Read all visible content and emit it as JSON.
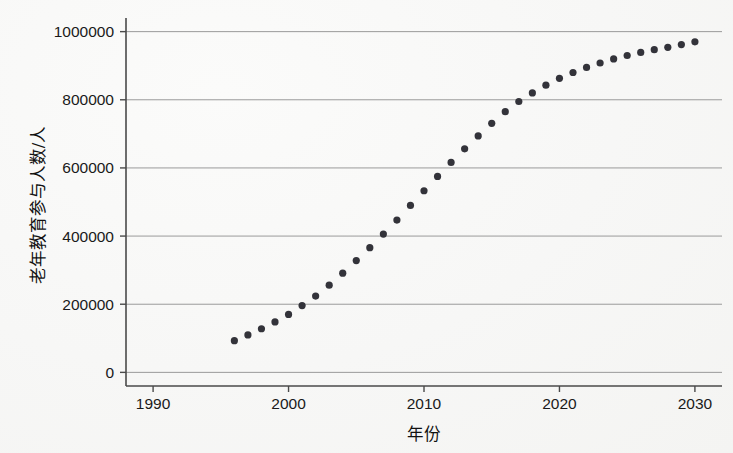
{
  "figure": {
    "background_color": "#f7f7f6",
    "marker_color": "#33333a",
    "grid_color": "#9a9a9a",
    "axis_color": "#4a4a4a"
  },
  "chart_data": {
    "type": "scatter",
    "title": "",
    "xlabel": "年份",
    "ylabel": "老年教育参与人数/人",
    "xlim": [
      1988,
      2032
    ],
    "ylim": [
      -40000,
      1040000
    ],
    "xticks": [
      1990,
      2000,
      2010,
      2020,
      2030
    ],
    "xtick_labels": [
      "1990",
      "2000",
      "2010",
      "2020",
      "2030"
    ],
    "yticks": [
      0,
      200000,
      400000,
      600000,
      800000,
      1000000
    ],
    "ytick_labels": [
      "0",
      "200000",
      "400000",
      "600000",
      "800000",
      "1000000"
    ],
    "grid": true,
    "grid_axis": "y",
    "legend": false,
    "legend_position": "none",
    "series": [
      {
        "name": "老年教育参与人数",
        "marker": "circle",
        "x": [
          1996,
          1997,
          1998,
          1999,
          2000,
          2001,
          2002,
          2003,
          2004,
          2005,
          2006,
          2007,
          2008,
          2009,
          2010,
          2011,
          2012,
          2013,
          2014,
          2015,
          2016,
          2017,
          2018,
          2019,
          2020,
          2021,
          2022,
          2023,
          2024,
          2025,
          2026,
          2027,
          2028,
          2029,
          2030
        ],
        "values": [
          93000,
          110000,
          128000,
          148000,
          170000,
          196000,
          224000,
          256000,
          291000,
          328000,
          366000,
          406000,
          447000,
          490000,
          533000,
          575000,
          616000,
          656000,
          694000,
          731000,
          765000,
          795000,
          820000,
          843000,
          863000,
          880000,
          895000,
          908000,
          920000,
          930000,
          939000,
          947000,
          954000,
          962000,
          970000
        ]
      }
    ]
  }
}
